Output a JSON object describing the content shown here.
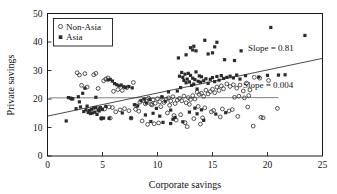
{
  "chart_data": {
    "type": "scatter",
    "title": "",
    "xlabel": "Corporate savings",
    "ylabel": "Private savings",
    "xlim": [
      0,
      25
    ],
    "ylim": [
      0,
      50
    ],
    "xticks": [
      0,
      5,
      10,
      15,
      20,
      25
    ],
    "yticks": [
      0,
      10,
      20,
      30,
      40,
      50
    ],
    "xtick_labels": [
      "0",
      "5",
      "10",
      "15",
      "20",
      "25"
    ],
    "ytick_labels": [
      "0",
      "10",
      "20",
      "30",
      "40",
      "50"
    ],
    "grid": false,
    "legend_position": "top-left",
    "legend": [
      {
        "name": "Non-Asia",
        "marker": "open-circle"
      },
      {
        "name": "Asia",
        "marker": "filled-square"
      }
    ],
    "annotations": [
      {
        "text": "Slope = 0.81",
        "x": 20.3,
        "y": 33.6,
        "series": "Asia"
      },
      {
        "text": "Slope = 0.004",
        "x": 19.6,
        "y": 23.2,
        "series": "Non-Asia"
      }
    ],
    "trend_lines": [
      {
        "name": "Asia",
        "slope": 0.81,
        "intercept": 14.0,
        "x_start": 0.0,
        "x_end": 25.0,
        "label": "Slope = 0.81"
      },
      {
        "name": "Non-Asia",
        "slope": 0.004,
        "intercept": 20.4,
        "x_start": 0.2,
        "x_end": 21.0,
        "label": "Slope = 0.004"
      }
    ],
    "series": [
      {
        "name": "Asia",
        "marker": "filled-square",
        "color": "#2b2b2b",
        "points": [
          [
            1.7,
            12.3
          ],
          [
            2.1,
            20.3
          ],
          [
            2.3,
            20.1
          ],
          [
            2.6,
            16.6
          ],
          [
            2.9,
            19.0
          ],
          [
            3.0,
            17.2
          ],
          [
            3.2,
            22.0
          ],
          [
            3.3,
            15.6
          ],
          [
            3.5,
            16.2
          ],
          [
            3.6,
            17.5
          ],
          [
            3.7,
            15.3
          ],
          [
            3.8,
            16.0
          ],
          [
            3.9,
            14.9
          ],
          [
            4.0,
            16.4
          ],
          [
            4.1,
            15.1
          ],
          [
            4.2,
            16.8
          ],
          [
            4.3,
            15.4
          ],
          [
            4.4,
            17.0
          ],
          [
            4.5,
            14.6
          ],
          [
            4.6,
            16.1
          ],
          [
            4.7,
            15.8
          ],
          [
            4.8,
            16.9
          ],
          [
            4.9,
            13.2
          ],
          [
            5.0,
            16.3
          ],
          [
            5.1,
            13.3
          ],
          [
            5.3,
            17.4
          ],
          [
            5.5,
            26.7
          ],
          [
            5.7,
            26.9
          ],
          [
            5.9,
            26.3
          ],
          [
            6.1,
            25.4
          ],
          [
            6.3,
            25.0
          ],
          [
            6.5,
            24.6
          ],
          [
            6.7,
            24.9
          ],
          [
            6.9,
            24.3
          ],
          [
            7.1,
            24.1
          ],
          [
            7.4,
            24.4
          ],
          [
            7.7,
            23.9
          ],
          [
            7.9,
            18.0
          ],
          [
            8.2,
            17.6
          ],
          [
            8.5,
            19.4
          ],
          [
            8.8,
            20.0
          ],
          [
            9.0,
            18.6
          ],
          [
            9.3,
            19.8
          ],
          [
            9.6,
            15.0
          ],
          [
            9.9,
            16.7
          ],
          [
            10.2,
            14.0
          ],
          [
            10.4,
            20.7
          ],
          [
            10.7,
            19.2
          ],
          [
            11.0,
            22.5
          ],
          [
            11.2,
            16.1
          ],
          [
            11.4,
            12.9
          ],
          [
            11.6,
            13.5
          ],
          [
            11.8,
            22.8
          ],
          [
            11.9,
            34.4
          ],
          [
            12.0,
            28.0
          ],
          [
            12.1,
            24.0
          ],
          [
            12.2,
            29.3
          ],
          [
            12.3,
            27.6
          ],
          [
            12.4,
            26.5
          ],
          [
            12.5,
            28.7
          ],
          [
            12.6,
            25.7
          ],
          [
            12.7,
            27.0
          ],
          [
            12.8,
            29.0
          ],
          [
            12.9,
            26.0
          ],
          [
            13.0,
            28.3
          ],
          [
            13.1,
            24.8
          ],
          [
            13.2,
            27.3
          ],
          [
            13.3,
            25.2
          ],
          [
            13.4,
            26.8
          ],
          [
            13.5,
            29.5
          ],
          [
            13.6,
            23.5
          ],
          [
            13.7,
            26.2
          ],
          [
            13.8,
            28.1
          ],
          [
            13.9,
            25.9
          ],
          [
            14.0,
            27.8
          ],
          [
            13.0,
            38.0
          ],
          [
            13.2,
            37.2
          ],
          [
            13.3,
            38.5
          ],
          [
            13.5,
            36.9
          ],
          [
            12.6,
            35.5
          ],
          [
            14.3,
            40.6
          ],
          [
            14.6,
            35.8
          ],
          [
            15.2,
            38.3
          ],
          [
            15.4,
            39.9
          ],
          [
            15.0,
            36.2
          ],
          [
            16.1,
            33.8
          ],
          [
            17.0,
            33.5
          ],
          [
            17.6,
            36.9
          ],
          [
            20.3,
            45.1
          ],
          [
            23.4,
            42.3
          ],
          [
            14.2,
            26.4
          ],
          [
            14.4,
            27.1
          ],
          [
            14.6,
            25.5
          ],
          [
            14.8,
            26.9
          ],
          [
            15.0,
            27.5
          ],
          [
            15.2,
            26.1
          ],
          [
            15.4,
            27.9
          ],
          [
            15.6,
            26.6
          ],
          [
            15.8,
            28.2
          ],
          [
            16.0,
            27.2
          ],
          [
            16.3,
            27.6
          ],
          [
            16.6,
            28.0
          ],
          [
            16.9,
            27.4
          ],
          [
            17.2,
            28.4
          ],
          [
            17.5,
            27.0
          ],
          [
            18.0,
            28.2
          ],
          [
            20.0,
            28.3
          ],
          [
            21.0,
            28.4
          ],
          [
            21.6,
            28.5
          ],
          [
            19.2,
            27.7
          ],
          [
            10.5,
            11.8
          ],
          [
            11.2,
            11.4
          ],
          [
            12.3,
            12.0
          ],
          [
            13.6,
            14.8
          ],
          [
            14.2,
            12.5
          ],
          [
            15.3,
            14.7
          ],
          [
            16.2,
            15.2
          ],
          [
            12.9,
            15.4
          ],
          [
            13.4,
            16.8
          ],
          [
            14.0,
            16.2
          ],
          [
            9.4,
            12.1
          ],
          [
            8.9,
            14.4
          ],
          [
            7.6,
            13.3
          ],
          [
            6.8,
            15.1
          ],
          [
            5.6,
            13.2
          ],
          [
            4.4,
            20.6
          ],
          [
            3.4,
            23.8
          ],
          [
            2.8,
            20.8
          ],
          [
            2.2,
            20.0
          ],
          [
            1.9,
            20.5
          ]
        ]
      },
      {
        "name": "Non-Asia",
        "marker": "open-circle",
        "color": "#2b2b2b",
        "points": [
          [
            2.7,
            29.2
          ],
          [
            2.9,
            28.4
          ],
          [
            3.1,
            24.8
          ],
          [
            3.4,
            28.9
          ],
          [
            3.6,
            24.2
          ],
          [
            4.2,
            28.5
          ],
          [
            4.4,
            29.0
          ],
          [
            4.6,
            23.7
          ],
          [
            4.9,
            13.2
          ],
          [
            5.1,
            26.4
          ],
          [
            5.3,
            27.0
          ],
          [
            5.5,
            27.4
          ],
          [
            5.7,
            13.3
          ],
          [
            6.0,
            22.7
          ],
          [
            6.4,
            23.3
          ],
          [
            6.8,
            23.0
          ],
          [
            7.2,
            24.0
          ],
          [
            7.6,
            13.3
          ],
          [
            7.8,
            25.8
          ],
          [
            8.1,
            17.6
          ],
          [
            8.4,
            18.9
          ],
          [
            8.7,
            19.5
          ],
          [
            9.0,
            19.1
          ],
          [
            9.2,
            20.3
          ],
          [
            9.4,
            18.2
          ],
          [
            9.6,
            19.7
          ],
          [
            9.8,
            18.5
          ],
          [
            10.0,
            20.1
          ],
          [
            10.2,
            19.0
          ],
          [
            10.4,
            20.6
          ],
          [
            10.6,
            18.8
          ],
          [
            10.8,
            19.9
          ],
          [
            11.0,
            20.4
          ],
          [
            11.2,
            19.3
          ],
          [
            11.4,
            20.8
          ],
          [
            11.6,
            18.4
          ],
          [
            11.8,
            19.6
          ],
          [
            12.0,
            20.2
          ],
          [
            12.2,
            19.4
          ],
          [
            12.4,
            21.0
          ],
          [
            12.6,
            18.7
          ],
          [
            12.8,
            20.5
          ],
          [
            13.0,
            19.8
          ],
          [
            13.2,
            21.2
          ],
          [
            13.4,
            20.0
          ],
          [
            13.6,
            22.4
          ],
          [
            13.8,
            21.6
          ],
          [
            14.0,
            22.0
          ],
          [
            14.2,
            20.9
          ],
          [
            14.4,
            23.1
          ],
          [
            14.6,
            21.8
          ],
          [
            14.8,
            22.6
          ],
          [
            15.0,
            23.4
          ],
          [
            15.2,
            22.2
          ],
          [
            15.4,
            24.2
          ],
          [
            15.6,
            23.0
          ],
          [
            15.8,
            24.6
          ],
          [
            16.0,
            23.6
          ],
          [
            16.3,
            25.3
          ],
          [
            16.6,
            24.4
          ],
          [
            16.9,
            25.0
          ],
          [
            17.2,
            23.8
          ],
          [
            17.5,
            24.9
          ],
          [
            17.8,
            22.8
          ],
          [
            18.1,
            25.6
          ],
          [
            18.4,
            23.2
          ],
          [
            18.8,
            27.6
          ],
          [
            19.3,
            27.3
          ],
          [
            20.1,
            26.5
          ],
          [
            17.0,
            20.6
          ],
          [
            17.4,
            21.0
          ],
          [
            17.9,
            20.4
          ],
          [
            18.3,
            21.2
          ],
          [
            9.7,
            11.3
          ],
          [
            10.1,
            11.6
          ],
          [
            10.9,
            15.1
          ],
          [
            11.5,
            14.2
          ],
          [
            12.1,
            14.5
          ],
          [
            12.7,
            10.3
          ],
          [
            13.3,
            13.1
          ],
          [
            14.1,
            13.4
          ],
          [
            14.9,
            15.5
          ],
          [
            15.7,
            13.7
          ],
          [
            16.5,
            15.8
          ],
          [
            17.3,
            13.9
          ],
          [
            18.2,
            17.2
          ],
          [
            19.4,
            13.6
          ],
          [
            19.6,
            13.4
          ],
          [
            20.9,
            16.7
          ],
          [
            18.7,
            10.5
          ],
          [
            6.6,
            16.2
          ],
          [
            7.0,
            16.6
          ],
          [
            7.4,
            15.9
          ],
          [
            8.0,
            16.4
          ],
          [
            8.3,
            15.7
          ],
          [
            5.9,
            17.0
          ],
          [
            6.2,
            15.5
          ],
          [
            4.8,
            16.8
          ],
          [
            5.2,
            16.5
          ],
          [
            5.6,
            17.2
          ],
          [
            8.6,
            12.3
          ],
          [
            9.1,
            11.1
          ],
          [
            11.7,
            12.6
          ],
          [
            12.5,
            11.7
          ],
          [
            13.9,
            11.2
          ],
          [
            15.1,
            16.0
          ],
          [
            15.9,
            16.5
          ],
          [
            16.8,
            16.3
          ],
          [
            14.3,
            16.9
          ],
          [
            13.7,
            17.4
          ],
          [
            11.1,
            17.8
          ],
          [
            10.3,
            17.3
          ],
          [
            9.5,
            17.9
          ],
          [
            8.9,
            18.3
          ],
          [
            12.9,
            18.1
          ]
        ]
      }
    ]
  }
}
